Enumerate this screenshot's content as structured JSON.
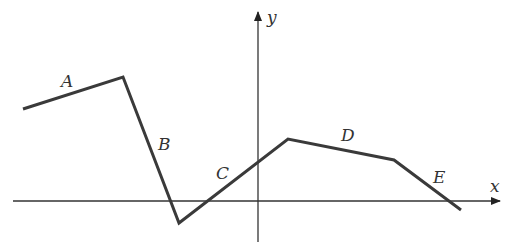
{
  "diagram": {
    "axes": {
      "x_label": "x",
      "y_label": "y",
      "x_axis": {
        "x1": 13,
        "y": 201,
        "x2": 500
      },
      "y_axis": {
        "x": 258,
        "y1": 242,
        "y2": 12
      }
    },
    "segments": [
      {
        "label": "A",
        "from": [
          23,
          109
        ],
        "to": [
          123,
          77
        ],
        "label_pos": [
          62,
          86
        ]
      },
      {
        "label": "B",
        "from": [
          123,
          77
        ],
        "to": [
          179,
          223
        ],
        "label_pos": [
          158,
          150
        ]
      },
      {
        "label": "C",
        "from": [
          179,
          223
        ],
        "to": [
          288,
          139
        ],
        "label_pos": [
          216,
          178
        ]
      },
      {
        "label": "D",
        "from": [
          288,
          139
        ],
        "to": [
          394,
          160
        ],
        "label_pos": [
          342,
          141
        ]
      },
      {
        "label": "E",
        "from": [
          394,
          160
        ],
        "to": [
          461,
          210
        ],
        "label_pos": [
          432,
          184
        ]
      }
    ],
    "colors": {
      "line": "#3a3a3a",
      "axis": "#333333"
    }
  }
}
